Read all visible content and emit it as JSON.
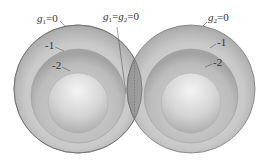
{
  "figure": {
    "left_sphere": {
      "function_label": "g",
      "function_subscript": "1",
      "levels": [
        "=0",
        "-1",
        "-2"
      ]
    },
    "right_sphere": {
      "function_label": "g",
      "function_subscript": "2",
      "levels": [
        "=0",
        "-1",
        "-2"
      ]
    },
    "intersection": {
      "label_g1": "g",
      "label_g1_sub": "1",
      "eq1": "=",
      "label_g2": "g",
      "label_g2_sub": "2",
      "eq2": "=0"
    },
    "colors": {
      "outer_ring": "#c8c8c8",
      "middle_ring": "#bdbdbd",
      "inner_core": "#d9d9d9",
      "overlap": "#8f8f8f",
      "edge": "#7a7a7a",
      "text": "#333333"
    }
  }
}
